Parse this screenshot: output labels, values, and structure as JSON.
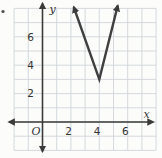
{
  "figure": {
    "description_label": "coordinate-grid-with-absolute-value-graph"
  },
  "chart_data": {
    "type": "line",
    "title": "",
    "xlabel": "x",
    "ylabel": "y",
    "origin_label": "O",
    "xlim": [
      -2,
      8
    ],
    "ylim": [
      -2,
      8
    ],
    "xticks": [
      2,
      4,
      6
    ],
    "yticks": [
      2,
      4,
      6
    ],
    "grid": true,
    "legend": "none",
    "series": [
      {
        "name": "absolute-value-graph",
        "shape": "V-opening-upward",
        "vertex": [
          4,
          3
        ],
        "points": [
          [
            2.2,
            8.1
          ],
          [
            4,
            3
          ],
          [
            5.3,
            8.2
          ]
        ],
        "arrows_at_ends": true
      }
    ],
    "colors": {
      "background": "#fcfcfb",
      "grid": "#d0d5d9",
      "axis": "#3a3a3a",
      "curve": "#3f3f3f",
      "text": "#333333"
    }
  }
}
